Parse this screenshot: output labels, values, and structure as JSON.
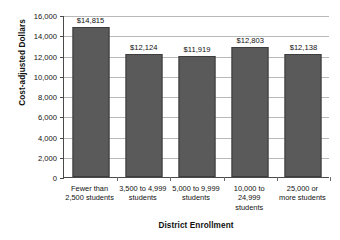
{
  "chart_data": {
    "type": "bar",
    "title": "",
    "xlabel": "District Enrollment",
    "ylabel": "Cost-adjusted Dollars",
    "categories": [
      "Fewer than\n2,500 students",
      "3,500 to 4,999\nstudents",
      "5,000 to 9,999\nstudents",
      "10,000 to\n24,999\nstudents",
      "25,000 or\nmore students"
    ],
    "category_lines": [
      [
        "Fewer than",
        "2,500 students"
      ],
      [
        "3,500 to 4,999",
        "students"
      ],
      [
        "5,000 to 9,999",
        "students"
      ],
      [
        "10,000 to",
        "24,999",
        "students"
      ],
      [
        "25,000 or",
        "more students"
      ]
    ],
    "values": [
      14815,
      12124,
      11919,
      12803,
      12138
    ],
    "value_labels": [
      "$14,815",
      "$12,124",
      "$11,919",
      "$12,803",
      "$12,138"
    ],
    "ylim": [
      0,
      16000
    ],
    "ytick_values": [
      0,
      2000,
      4000,
      6000,
      8000,
      10000,
      12000,
      14000,
      16000
    ],
    "ytick_labels": [
      "0",
      "2,000",
      "4,000",
      "6,000",
      "8,000",
      "10,000",
      "12,000",
      "14,000",
      "16,000"
    ],
    "grid": true,
    "legend": "none",
    "bar_color": "#5a5a5a",
    "gridline_color": "#b9b9b9",
    "axis_color": "#4a4a4a"
  }
}
